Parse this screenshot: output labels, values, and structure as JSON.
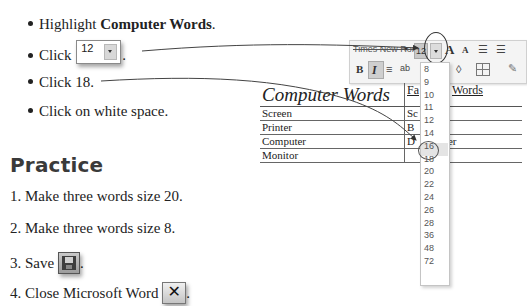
{
  "instructions": {
    "steps": [
      {
        "prefix": "Highlight ",
        "bold": "Computer Words",
        "suffix": "."
      },
      {
        "prefix": "Click ",
        "suffix": ".",
        "inline_control": {
          "value": "12",
          "icon": "dropdown-arrow-icon"
        }
      },
      {
        "text": "Click 18."
      },
      {
        "text": "Click on white space."
      }
    ]
  },
  "practice": {
    "heading": "Practice",
    "items": [
      {
        "text": "1. Make three words size 20."
      },
      {
        "text": "2. Make three words size 8."
      },
      {
        "text": "3. Save",
        "suffix": ".",
        "icon": "save-icon"
      },
      {
        "text": "4. Close Microsoft Word",
        "suffix": ".",
        "icon": "close-icon",
        "icon_glyph": "✕"
      }
    ]
  },
  "toolbar": {
    "font_name": "Times New Rom",
    "font_size": "12",
    "grow_font": "A",
    "shrink_font": "A",
    "bold": "B",
    "italic": "I",
    "align_glyph": "≡",
    "style_glyph": "ab",
    "paint_glyph": "◊"
  },
  "table": {
    "header": [
      "Computer Words",
      "Fa",
      "Words"
    ],
    "rows": [
      [
        "Screen",
        "Sc",
        ""
      ],
      [
        "Printer",
        "B",
        ""
      ],
      [
        "Computer",
        "D",
        "er"
      ],
      [
        "Monitor",
        "",
        ""
      ]
    ]
  },
  "font_size_dropdown": {
    "options": [
      "8",
      "9",
      "10",
      "11",
      "12",
      "14",
      "16",
      "18",
      "20",
      "22",
      "24",
      "26",
      "28",
      "36",
      "48",
      "72"
    ],
    "selected": "18"
  }
}
